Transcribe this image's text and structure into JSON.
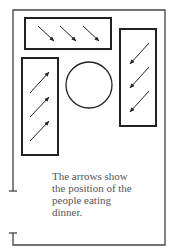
{
  "diagram": {
    "caption_lines": [
      "The arrows show",
      "the position of the",
      "people eating",
      "dinner."
    ],
    "elements": {
      "room": "outer-wall",
      "tables": [
        "top-table",
        "left-table",
        "right-table",
        "round-table"
      ],
      "arrows": {
        "top-table": 3,
        "left-table": 3,
        "right-table": 3
      }
    }
  }
}
